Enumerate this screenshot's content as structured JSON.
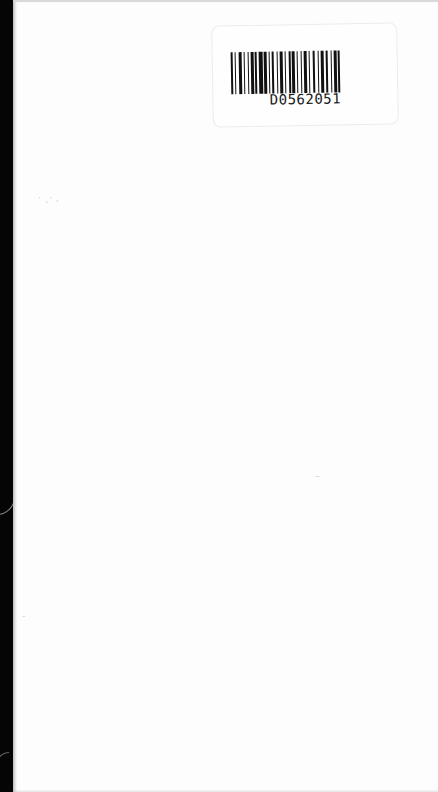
{
  "document": {
    "type": "scanned-page",
    "barcode_label": {
      "code": "D0562051"
    }
  }
}
